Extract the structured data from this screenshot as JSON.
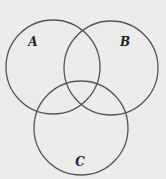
{
  "diagram": {
    "type": "venn",
    "background": "#ececec",
    "stroke_color": "#555555",
    "sets": [
      {
        "label": "A",
        "cx": 53,
        "cy": 67,
        "r": 47,
        "label_x": 33,
        "label_y": 46
      },
      {
        "label": "B",
        "cx": 111,
        "cy": 68,
        "r": 47,
        "label_x": 125,
        "label_y": 46
      },
      {
        "label": "C",
        "cx": 81,
        "cy": 128,
        "r": 47,
        "label_x": 80,
        "label_y": 166
      }
    ]
  }
}
